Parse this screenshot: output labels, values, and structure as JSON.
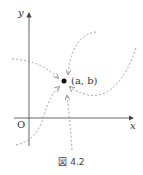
{
  "diagram": {
    "axis_x_label": "x",
    "axis_y_label": "y",
    "origin_label": "O",
    "point_label": "(a, b)",
    "caption": "図 4.2",
    "colors": {
      "axis": "#555555",
      "path": "#999999",
      "point": "#111111"
    }
  }
}
